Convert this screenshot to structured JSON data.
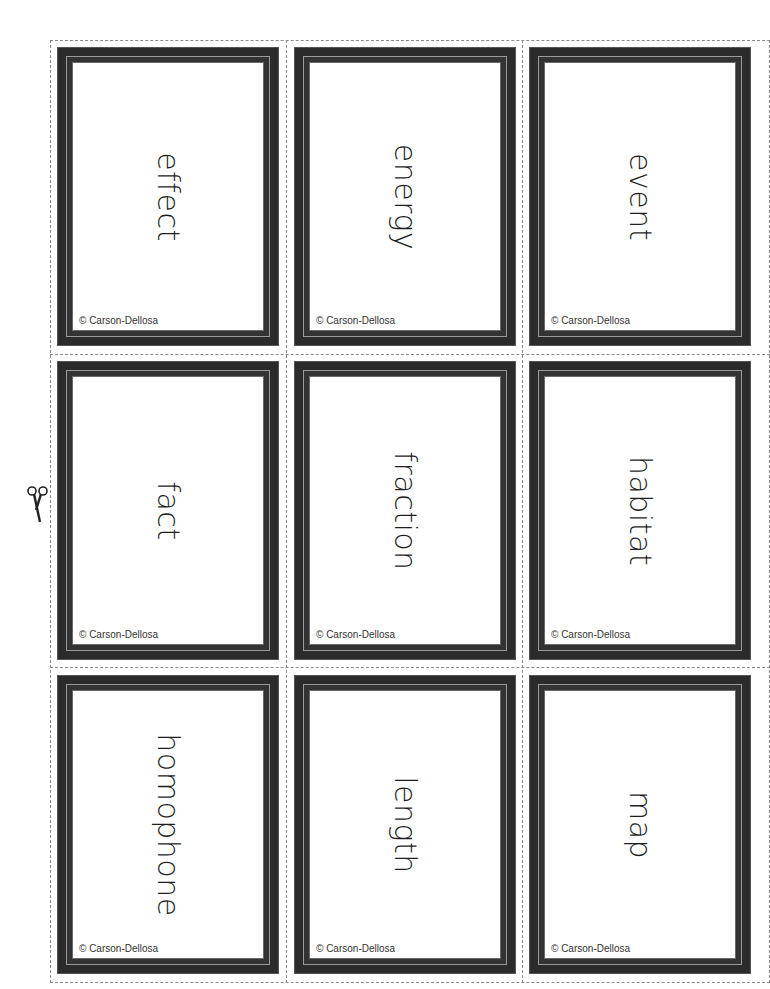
{
  "sheet": {
    "title": "Vocabulary flashcards",
    "cut_line_color": "#8a8a8a",
    "frame_color": "#2b2b2b",
    "cards": [
      {
        "word": "effect",
        "copyright": "© Carson-Dellosa"
      },
      {
        "word": "energy",
        "copyright": "© Carson-Dellosa"
      },
      {
        "word": "event",
        "copyright": "© Carson-Dellosa"
      },
      {
        "word": "fact",
        "copyright": "© Carson-Dellosa"
      },
      {
        "word": "fraction",
        "copyright": "© Carson-Dellosa"
      },
      {
        "word": "habitat",
        "copyright": "© Carson-Dellosa"
      },
      {
        "word": "homophone",
        "copyright": "© Carson-Dellosa"
      },
      {
        "word": "length",
        "copyright": "© Carson-Dellosa"
      },
      {
        "word": "map",
        "copyright": "© Carson-Dellosa"
      }
    ]
  },
  "icons": {
    "scissors": "scissors-icon"
  }
}
